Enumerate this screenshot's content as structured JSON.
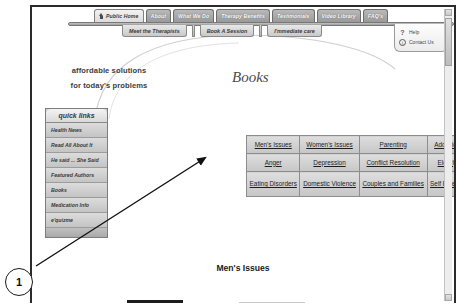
{
  "annotation": {
    "marker_label": "1"
  },
  "nav": {
    "primary": [
      {
        "label": "Public Home",
        "icon": "home-icon",
        "active": true
      },
      {
        "label": "About",
        "active": false
      },
      {
        "label": "What We Do",
        "active": false
      },
      {
        "label": "Therapy Benefits",
        "active": false
      },
      {
        "label": "Testimonials",
        "active": false
      },
      {
        "label": "Video Library",
        "active": false
      },
      {
        "label": "FAQ's",
        "active": false
      }
    ],
    "secondary": [
      {
        "label": "Meet the Therapists"
      },
      {
        "label": "Book A Session"
      },
      {
        "label": "I'mmediate care"
      }
    ]
  },
  "help_box": {
    "help_label": "Help",
    "help_icon": "question-mark-icon",
    "contact_label": "Contact Us",
    "contact_icon": "info-circle-icon"
  },
  "tagline": {
    "line1": "affordable solutions",
    "line2": "for today's problems"
  },
  "page_title": "Books",
  "sidebar": {
    "header": "quick links",
    "items": [
      {
        "label": "Health News"
      },
      {
        "label": "Read All About It"
      },
      {
        "label": "He said ... She Said"
      },
      {
        "label": "Featured Authors"
      },
      {
        "label": "Books"
      },
      {
        "label": "Medication Info"
      },
      {
        "label": "e'quizme"
      }
    ]
  },
  "category_grid": {
    "rows": [
      [
        {
          "label": "Men's Issues"
        },
        {
          "label": "Women's Issues"
        },
        {
          "label": "Parenting"
        },
        {
          "label": "Addiction"
        }
      ],
      [
        {
          "label": "Anger"
        },
        {
          "label": "Depression"
        },
        {
          "label": "Conflict Resolution"
        },
        {
          "label": "Elderly"
        }
      ],
      [
        {
          "label": "Eating Disorders"
        },
        {
          "label": "Domestic Violence"
        },
        {
          "label": "Couples and Families"
        },
        {
          "label": "Self Esteem"
        }
      ]
    ]
  },
  "section": {
    "heading": "Men's Issues",
    "book_title_partial": "DEVOUR"
  },
  "colors": {
    "frame_border": "#2b2b2b",
    "tab_gray": "#9a9a9a",
    "panel_gray": "#c6c6c6",
    "text_dark": "#3a3a3a"
  }
}
